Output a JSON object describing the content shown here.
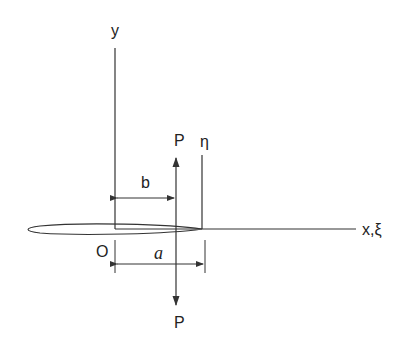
{
  "diagram": {
    "type": "crack-with-point-loads",
    "labels": {
      "y_axis": "y",
      "x_axis": "x,ξ",
      "eta_axis": "η",
      "origin": "O",
      "load_top": "P",
      "load_bottom": "P",
      "dim_b": "b",
      "dim_a": "a"
    },
    "colors": {
      "stroke": "#333333",
      "background": "#ffffff"
    }
  }
}
